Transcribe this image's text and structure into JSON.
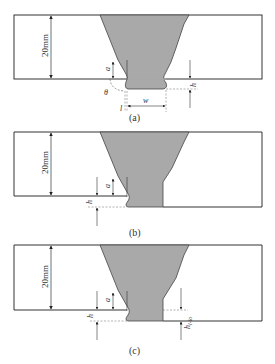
{
  "figure": {
    "colors": {
      "weld_fill": "#a9a9a9",
      "line": "#333333",
      "background": "#ffffff"
    },
    "panels": [
      {
        "id": "a",
        "caption": "(a)",
        "thickness_label": "20mm",
        "labels": {
          "a": "a",
          "h": "h",
          "theta": "θ",
          "l": "l",
          "w": "w"
        }
      },
      {
        "id": "b",
        "caption": "(b)",
        "thickness_label": "20mm",
        "labels": {
          "a": "a",
          "h": "h"
        }
      },
      {
        "id": "c",
        "caption": "(c)",
        "thickness_label": "20mm",
        "labels": {
          "a": "a",
          "h": "h",
          "h_sub": "h",
          "h_sub_index": "l-lo"
        }
      }
    ]
  }
}
